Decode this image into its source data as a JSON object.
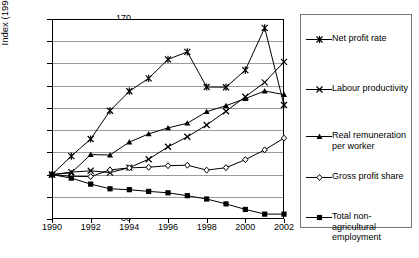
{
  "chart_data": {
    "type": "line",
    "title": "",
    "xlabel": "",
    "ylabel": "Index (1990=100)",
    "x": [
      1990,
      1991,
      1992,
      1993,
      1994,
      1995,
      1996,
      1997,
      1998,
      1999,
      2000,
      2001,
      2002
    ],
    "xtick_labels": [
      "1990",
      "1992",
      "1994",
      "1996",
      "1998",
      "2000",
      "2002"
    ],
    "xticks": [
      1990,
      1992,
      1994,
      1996,
      1998,
      2000,
      2002
    ],
    "xlim": [
      1990,
      2002
    ],
    "ytick_labels": [
      "80",
      "90",
      "100",
      "110",
      "120",
      "130",
      "140",
      "150",
      "160",
      "170"
    ],
    "yticks": [
      80,
      90,
      100,
      110,
      120,
      130,
      140,
      150,
      160,
      170
    ],
    "ylim": [
      80,
      170
    ],
    "grid": true,
    "legend_position": "right",
    "series": [
      {
        "name": "Net profit rate",
        "marker": "asterisk",
        "values": [
          100.0,
          108.3,
          116.0,
          128.7,
          137.5,
          143.3,
          151.8,
          155.2,
          139.4,
          139.3,
          147.0,
          166.0,
          131.3
        ]
      },
      {
        "name": "Labour productivity",
        "marker": "x",
        "values": [
          100.0,
          101.1,
          101.7,
          100.9,
          103.1,
          106.9,
          112.5,
          117.0,
          122.3,
          128.5,
          135.0,
          141.5,
          150.7
        ]
      },
      {
        "name": "Real remuneration per worker",
        "marker": "triangle",
        "values": [
          100.0,
          100.8,
          109.0,
          108.8,
          114.6,
          118.3,
          121.0,
          123.1,
          128.3,
          131.0,
          134.2,
          137.6,
          136.0
        ]
      },
      {
        "name": "Gross profit share",
        "marker": "diamond",
        "values": [
          100.0,
          99.2,
          99.1,
          102.1,
          103.0,
          103.3,
          104.0,
          104.2,
          102.0,
          103.1,
          106.7,
          111.1,
          116.4
        ]
      },
      {
        "name": "Total non-agricultural employment",
        "marker": "square",
        "values": [
          100.0,
          98.4,
          95.7,
          93.6,
          93.2,
          92.4,
          91.8,
          90.5,
          89.0,
          86.8,
          84.3,
          82.2,
          82.2
        ]
      }
    ]
  },
  "legend": {
    "items": [
      {
        "label": "Net profit rate",
        "marker": "asterisk-marker"
      },
      {
        "label": "Labour productivity",
        "marker": "x-marker"
      },
      {
        "label": "Real remuneration\nper worker",
        "marker": "triangle-marker"
      },
      {
        "label": "Gross profit share",
        "marker": "diamond-marker"
      },
      {
        "label": "Total non-\nagricultural\nemployment",
        "marker": "square-marker"
      }
    ]
  }
}
